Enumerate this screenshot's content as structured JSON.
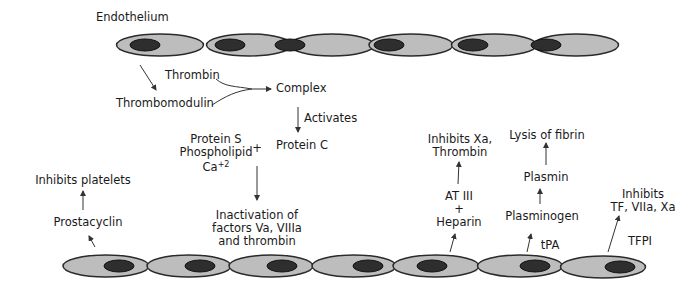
{
  "title": "Endothelium",
  "colors": {
    "cell_fill": "#bdbdbd",
    "nucleus_fill": "#2e2e2e",
    "outline": "#2a2a2a",
    "text": "#1a1a1a",
    "arrow": "#333333"
  },
  "top_layer": {
    "cells": [
      {
        "cx": 160,
        "cy": 45,
        "rx": 85,
        "ry": 11,
        "nucleus_cx": 145
      },
      {
        "cx": 249,
        "cy": 45,
        "rx": 83,
        "ry": 11,
        "nucleus_cx": 230
      },
      {
        "cx": 332,
        "cy": 45,
        "rx": 82,
        "ry": 11,
        "nucleus_cx": 290
      },
      {
        "cx": 411,
        "cy": 45,
        "rx": 82,
        "ry": 11,
        "nucleus_cx": 389
      },
      {
        "cx": 494,
        "cy": 45,
        "rx": 83,
        "ry": 11,
        "nucleus_cx": 473
      },
      {
        "cx": 576,
        "cy": 45,
        "rx": 83,
        "ry": 11,
        "nucleus_cx": 546
      }
    ]
  },
  "bottom_layer": {
    "cells": [
      {
        "cx": 106,
        "cy": 266,
        "rx": 84,
        "ry": 11,
        "nucleus_cx": 119
      },
      {
        "cx": 189,
        "cy": 266,
        "rx": 82,
        "ry": 11,
        "nucleus_cx": 200
      },
      {
        "cx": 271,
        "cy": 266,
        "rx": 82,
        "ry": 11,
        "nucleus_cx": 282
      },
      {
        "cx": 354,
        "cy": 266,
        "rx": 82,
        "ry": 11,
        "nucleus_cx": 368
      },
      {
        "cx": 436,
        "cy": 266,
        "rx": 84,
        "ry": 11,
        "nucleus_cx": 432
      },
      {
        "cx": 520,
        "cy": 266,
        "rx": 83,
        "ry": 11,
        "nucleus_cx": 535
      },
      {
        "cx": 603,
        "cy": 267,
        "rx": 83,
        "ry": 11,
        "nucleus_cx": 620
      }
    ]
  },
  "labels": {
    "thrombin": "Thrombin",
    "thrombomodulin": "Thrombomodulin",
    "complex": "Complex",
    "activates": "Activates",
    "protein_c": "Protein C",
    "protein_s": "Protein S",
    "phospholipid": "Phospholipid",
    "calcium_base": "Ca",
    "calcium_sup": "+2",
    "plus_1": "+",
    "inactivation_line1": "Inactivation of",
    "inactivation_line2": "factors Va, VIIIa",
    "inactivation_line3": "and thrombin",
    "inhibits_platelets": "Inhibits platelets",
    "prostacyclin": "Prostacyclin",
    "inhibits_xa_line1": "Inhibits Xa,",
    "inhibits_xa_line2": "Thrombin",
    "at_iii": "AT III",
    "plus_2": "+",
    "heparin": "Heparin",
    "lysis_of_fibrin": "Lysis of fibrin",
    "plasmin": "Plasmin",
    "plasminogen": "Plasminogen",
    "tpa": "tPA",
    "inhibits_tf_line1": "Inhibits",
    "inhibits_tf_line2": "TF, VIIa, Xa",
    "tfpi": "TFPI"
  }
}
